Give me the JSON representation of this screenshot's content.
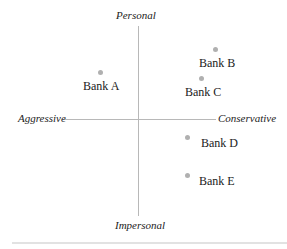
{
  "axes": {
    "top": "Personal",
    "bottom": "Impersonal",
    "left": "Aggressive",
    "right": "Conservative"
  },
  "points": [
    {
      "label": "Bank A",
      "x": -0.55,
      "y": 0.5
    },
    {
      "label": "Bank B",
      "x": 1.0,
      "y": 0.75
    },
    {
      "label": "Bank C",
      "x": 0.82,
      "y": 0.45
    },
    {
      "label": "Bank D",
      "x": 0.64,
      "y": -0.19
    },
    {
      "label": "Bank E",
      "x": 0.64,
      "y": -0.59
    }
  ],
  "colors": {
    "axis": "#b8b8b8",
    "dot": "#b0b0b0",
    "text": "#222222"
  }
}
